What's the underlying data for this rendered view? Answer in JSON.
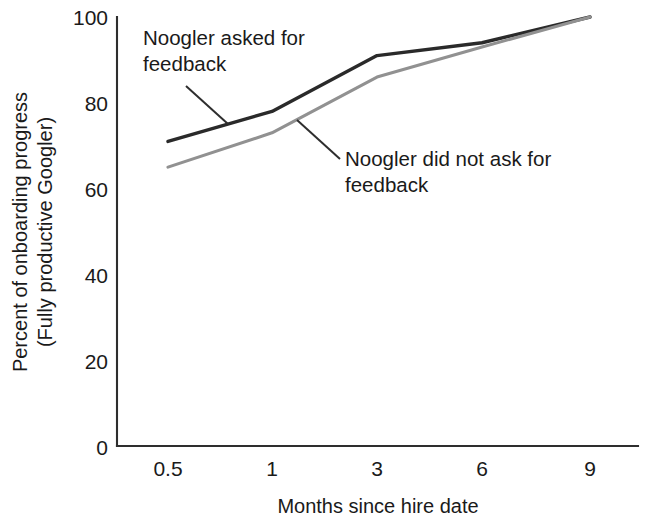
{
  "chart_data": {
    "type": "line",
    "title": "",
    "subtitle": "",
    "xlabel": "Months since hire date",
    "ylabel_line1": "Percent of onboarding progress",
    "ylabel_line2": "(Fully productive Googler)",
    "x_categories": [
      "0.5",
      "1",
      "3",
      "6",
      "9"
    ],
    "y_ticks": [
      "0",
      "20",
      "40",
      "60",
      "80",
      "100"
    ],
    "ylim": [
      0,
      100
    ],
    "grid": false,
    "legend_position": "inline-annotations",
    "series": [
      {
        "name": "Noogler asked for feedback",
        "color": "#2a2a2a",
        "values": [
          71,
          78,
          91,
          94,
          100
        ]
      },
      {
        "name": "Noogler did not ask for feedback",
        "color": "#919191",
        "values": [
          65,
          73,
          86,
          93,
          100
        ]
      }
    ],
    "annotations": [
      {
        "id": "asked",
        "line1": "Noogler asked for",
        "line2": "feedback",
        "text_x": 143,
        "text_y1": 45,
        "text_y2": 71,
        "leader_from_x": 186,
        "leader_from_y": 86,
        "leader_to_x": 228,
        "leader_to_y": 124
      },
      {
        "id": "did-not-ask",
        "line1": "Noogler did not ask for",
        "line2": "feedback",
        "text_x": 345,
        "text_y1": 166,
        "text_y2": 192,
        "leader_from_x": 297,
        "leader_from_y": 120,
        "leader_to_x": 340,
        "leader_to_y": 159
      }
    ]
  },
  "axes": {
    "y_tick_100": "100",
    "y_tick_80": "80",
    "y_tick_60": "60",
    "y_tick_40": "40",
    "y_tick_20": "20",
    "y_tick_0": "0",
    "x_tick_0": "0.5",
    "x_tick_1": "1",
    "x_tick_2": "3",
    "x_tick_3": "6",
    "x_tick_4": "9"
  }
}
